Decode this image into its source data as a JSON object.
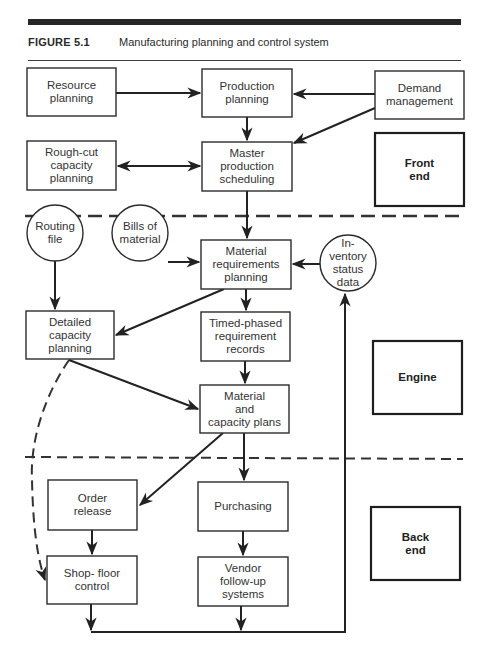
{
  "figure": {
    "number": "FIGURE 5.1",
    "title": "Manufacturing planning and control system"
  },
  "nodes": {
    "resource_planning": "Resource\nplanning",
    "production_planning": "Production\nplanning",
    "demand_management": "Demand\nmanagement",
    "rough_cut": "Rough-cut\ncapacity\nplanning",
    "master_production": "Master\nproduction\nscheduling",
    "routing_file": "Routing\nfile",
    "bills_of_material": "Bills of\nmaterial",
    "mrp": "Material\nrequirements\nplanning",
    "inventory_status": "In-\nventory\nstatus\ndata",
    "detailed_capacity": "Detailed\ncapacity\nplanning",
    "timed_phased": "Timed-phased\nrequirement\nrecords",
    "material_capacity_plans": "Material\nand\ncapacity plans",
    "order_release": "Order\nrelease",
    "purchasing": "Purchasing",
    "shop_floor": "Shop- floor\ncontrol",
    "vendor_followup": "Vendor\nfollow-up\nsystems"
  },
  "sections": {
    "front_end": "Front\nend",
    "engine": "Engine",
    "back_end": "Back\nend"
  },
  "edges": [
    {
      "from": "Resource planning",
      "to": "Production planning"
    },
    {
      "from": "Demand management",
      "to": "Production planning"
    },
    {
      "from": "Demand management",
      "to": "Master production scheduling"
    },
    {
      "from": "Production planning",
      "to": "Master production scheduling"
    },
    {
      "from": "Rough-cut capacity planning",
      "to": "Master production scheduling",
      "bidirectional": true
    },
    {
      "from": "Master production scheduling",
      "to": "Material requirements planning"
    },
    {
      "from": "Bills of material",
      "to": "Material requirements planning"
    },
    {
      "from": "Inventory status data",
      "to": "Material requirements planning"
    },
    {
      "from": "Routing file",
      "to": "Detailed capacity planning"
    },
    {
      "from": "Material requirements planning",
      "to": "Detailed capacity planning"
    },
    {
      "from": "Material requirements planning",
      "to": "Timed-phased requirement records"
    },
    {
      "from": "Timed-phased requirement records",
      "to": "Material and capacity plans"
    },
    {
      "from": "Detailed capacity planning",
      "to": "Material and capacity plans"
    },
    {
      "from": "Detailed capacity planning",
      "to": "Shop-floor control",
      "style": "dashed"
    },
    {
      "from": "Material and capacity plans",
      "to": "Order release"
    },
    {
      "from": "Material and capacity plans",
      "to": "Purchasing"
    },
    {
      "from": "Order release",
      "to": "Shop-floor control"
    },
    {
      "from": "Purchasing",
      "to": "Vendor follow-up systems"
    },
    {
      "from": "Shop-floor control",
      "to": "Inventory status data"
    },
    {
      "from": "Vendor follow-up systems",
      "to": "Inventory status data"
    }
  ]
}
